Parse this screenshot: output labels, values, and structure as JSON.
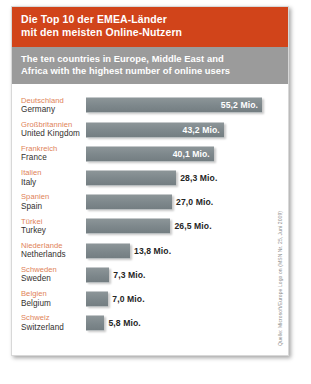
{
  "header": {
    "title_de_line1": "Die Top 10 der EMEA-Länder",
    "title_de_line2": "mit den meisten Online-Nutzern",
    "title_en_line1": "The ten countries in Europe, Middle East and",
    "title_en_line2": "Africa with the highest number of online users",
    "band_de_color": "#d1441a",
    "band_en_color": "#9b9b9b"
  },
  "source": {
    "text": "Quelle: Microsoft/Europe Logo on (MSN Nr. 25, Juni 2009)"
  },
  "chart_data": {
    "type": "bar",
    "title": "Die Top 10 der EMEA-Länder mit den meisten Online-Nutzern",
    "subtitle": "The ten countries in Europe, Middle East and Africa with the highest number of online users",
    "xlabel": "",
    "ylabel": "",
    "unit": "Mio.",
    "orientation": "horizontal",
    "grid": false,
    "legend": "none",
    "xlim": [
      0,
      55.2
    ],
    "bar_color": "#7d878b",
    "categories": [
      "Deutschland",
      "Großbritannien",
      "Frankreich",
      "Italien",
      "Spanien",
      "Türkei",
      "Niederlande",
      "Schweden",
      "Belgien",
      "Schweiz"
    ],
    "categories_en": [
      "Germany",
      "United Kingdom",
      "France",
      "Italy",
      "Spain",
      "Turkey",
      "Netherlands",
      "Sweden",
      "Belgium",
      "Switzerland"
    ],
    "values": [
      55.2,
      43.2,
      40.1,
      28.3,
      27.0,
      26.5,
      13.8,
      7.3,
      7.0,
      5.8
    ],
    "value_labels": [
      "55,2 Mio.",
      "43,2 Mio.",
      "40,1 Mio.",
      "28,3 Mio.",
      "27,0 Mio.",
      "26,5 Mio.",
      "13,8 Mio.",
      "7,3 Mio.",
      "7,0 Mio.",
      "5,8 Mio."
    ],
    "label_placement": [
      "inside",
      "inside",
      "inside",
      "outside",
      "outside",
      "outside",
      "outside",
      "outside",
      "outside",
      "outside"
    ]
  }
}
